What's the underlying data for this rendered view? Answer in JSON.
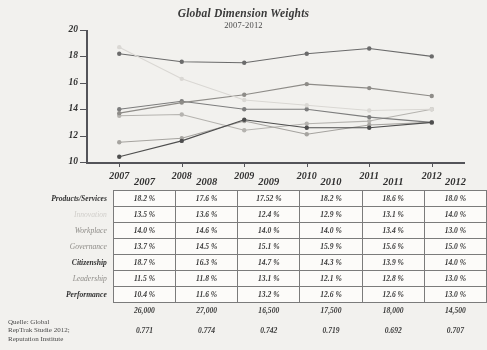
{
  "chart_data": {
    "type": "line",
    "title": "Global Dimension Weights",
    "subtitle": "2007-2012",
    "xlabel": "",
    "ylabel": "",
    "ylim": [
      10,
      20
    ],
    "yticks": [
      10,
      12,
      14,
      16,
      18,
      20
    ],
    "grid": false,
    "legend": "none",
    "categories": [
      "2007",
      "2008",
      "2009",
      "2010",
      "2011",
      "2012"
    ],
    "series": [
      {
        "name": "Products/Services",
        "color": "#6b6b6b",
        "values": [
          18.2,
          17.6,
          17.52,
          18.2,
          18.6,
          18.0
        ]
      },
      {
        "name": "Innovation",
        "color": "#b4b2ae",
        "values": [
          13.5,
          13.6,
          12.4,
          12.9,
          13.1,
          14.0
        ]
      },
      {
        "name": "Workplace",
        "color": "#7d7d7d",
        "values": [
          14.0,
          14.6,
          14.0,
          14.0,
          13.4,
          13.0
        ]
      },
      {
        "name": "Governance",
        "color": "#8e8c88",
        "values": [
          13.7,
          14.5,
          15.1,
          15.9,
          15.6,
          15.0
        ]
      },
      {
        "name": "Citizenship",
        "color": "#d8d6d2",
        "values": [
          18.7,
          16.3,
          14.7,
          14.3,
          13.9,
          14.0
        ]
      },
      {
        "name": "Leadership",
        "color": "#a5a39f",
        "values": [
          11.5,
          11.8,
          13.1,
          12.1,
          12.8,
          13.0
        ]
      },
      {
        "name": "Performance",
        "color": "#4f4f4f",
        "values": [
          10.4,
          11.6,
          13.2,
          12.6,
          12.6,
          13.0
        ]
      }
    ]
  },
  "table": {
    "year_headers": [
      "2007",
      "2008",
      "2009",
      "2010",
      "2011",
      "2012"
    ],
    "rows": [
      {
        "label": "Products/Services",
        "emphasis": "bold",
        "values": [
          "18.2 %",
          "17.6 %",
          "17.52 %",
          "18.2 %",
          "18.6 %",
          "18.0 %"
        ]
      },
      {
        "label": "Innovation",
        "emphasis": "faint",
        "values": [
          "13.5 %",
          "13.6 %",
          "12.4 %",
          "12.9 %",
          "13.1 %",
          "14.0 %"
        ]
      },
      {
        "label": "Workplace",
        "emphasis": "mid",
        "values": [
          "14.0 %",
          "14.6 %",
          "14.0 %",
          "14.0 %",
          "13.4 %",
          "13.0 %"
        ]
      },
      {
        "label": "Governance",
        "emphasis": "mid",
        "values": [
          "13.7 %",
          "14.5 %",
          "15.1 %",
          "15.9 %",
          "15.6 %",
          "15.0 %"
        ]
      },
      {
        "label": "Citizenship",
        "emphasis": "bold",
        "values": [
          "18.7 %",
          "16.3 %",
          "14.7 %",
          "14.3 %",
          "13.9 %",
          "14.0 %"
        ]
      },
      {
        "label": "Leadership",
        "emphasis": "mid",
        "values": [
          "11.5 %",
          "11.8 %",
          "13.1 %",
          "12.1 %",
          "12.8 %",
          "13.0 %"
        ]
      },
      {
        "label": "Performance",
        "emphasis": "bold",
        "values": [
          "10.4 %",
          "11.6 %",
          "13.2 %",
          "12.6 %",
          "12.6 %",
          "13.0 %"
        ]
      }
    ],
    "sample_sizes": [
      "26,000",
      "27,000",
      "16,500",
      "17,500",
      "18,000",
      "14,500"
    ],
    "alphas": [
      "0.771",
      "0.774",
      "0.742",
      "0.719",
      "0.692",
      "0.707"
    ]
  },
  "source": {
    "line1": "Quelle: Global",
    "line2": "RepTrak Studie 2012;",
    "line3": "Reputation Institute"
  }
}
